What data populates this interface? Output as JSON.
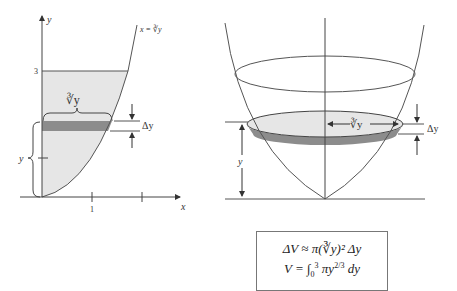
{
  "left_figure": {
    "axis_x_label": "x",
    "axis_y_label": "y",
    "tick_x_1": "1",
    "tick_y_3": "3",
    "curve_label": "x = ∛y",
    "strip_width_label": "∛y",
    "strip_height_label": "Δy",
    "height_label": "y"
  },
  "right_figure": {
    "radius_label": "∛y",
    "thickness_label": "Δy",
    "height_label": "y"
  },
  "formulas": {
    "line1_prefix": "ΔV ≈ π(",
    "line1_root": "∛y",
    "line1_suffix": ")² Δy",
    "line2_lhs": "V = ",
    "line2_integral": "∫",
    "line2_lower": "0",
    "line2_upper": "3",
    "line2_body": " πy",
    "line2_exp": "2/3",
    "line2_tail": " dy"
  },
  "colors": {
    "region_fill": "#e6e6e6",
    "strip_fill": "#8c8c8c",
    "line": "#555555"
  }
}
